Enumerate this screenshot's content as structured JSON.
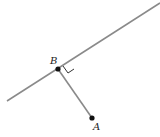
{
  "diagram": {
    "type": "geometry",
    "colors": {
      "line": "#8a8a8a",
      "point": "#111111",
      "label": "#222222",
      "background": "#ffffff"
    },
    "line": {
      "x1": 7,
      "y1": 101,
      "x2": 160,
      "y2": 3
    },
    "segment": {
      "from": "B",
      "to": "A"
    },
    "points": [
      {
        "name": "B",
        "x": 58,
        "y": 69,
        "label": "B",
        "label_x": 50,
        "label_y": 64
      },
      {
        "name": "A",
        "x": 92,
        "y": 118,
        "label": "A",
        "label_x": 93,
        "label_y": 130
      }
    ],
    "right_angle_marker": {
      "points": "63,66 68,73 74,69"
    }
  }
}
